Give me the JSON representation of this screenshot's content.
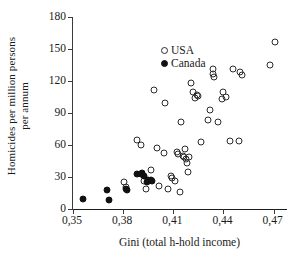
{
  "chart_data": {
    "type": "scatter",
    "title": "",
    "xlabel": "Gini (total h-hold income)",
    "ylabel_line1": "Homicides per million persons",
    "ylabel_line2": "per annum",
    "xlim": [
      0.35,
      0.478
    ],
    "ylim": [
      0,
      180
    ],
    "xticks": [
      0.35,
      0.38,
      0.41,
      0.44,
      0.47
    ],
    "xtick_labels": [
      "0,35",
      "0,38",
      "0,41",
      "0,44",
      "0,47"
    ],
    "yticks": [
      0,
      30,
      60,
      90,
      120,
      150,
      180
    ],
    "ytick_labels": [
      "0",
      "30",
      "60",
      "90",
      "120",
      "150",
      "180"
    ],
    "grid": false,
    "legend_position": "top-left",
    "marker_colors": {
      "usa": "#2b2b2b",
      "canada": "#111111"
    },
    "series": [
      {
        "name": "USA",
        "marker": "open-circle",
        "points": [
          [
            0.3805,
            25.5
          ],
          [
            0.3815,
            21.0
          ],
          [
            0.3885,
            65.0
          ],
          [
            0.3905,
            60.0
          ],
          [
            0.3925,
            26.5
          ],
          [
            0.3935,
            18.5
          ],
          [
            0.3965,
            36.5
          ],
          [
            0.3985,
            112.0
          ],
          [
            0.4,
            57.0
          ],
          [
            0.4015,
            22.0
          ],
          [
            0.4045,
            52.5
          ],
          [
            0.405,
            99.0
          ],
          [
            0.407,
            19.0
          ],
          [
            0.4085,
            31.0
          ],
          [
            0.4095,
            29.0
          ],
          [
            0.411,
            26.5
          ],
          [
            0.4125,
            53.5
          ],
          [
            0.413,
            52.0
          ],
          [
            0.414,
            15.5
          ],
          [
            0.4145,
            82.0
          ],
          [
            0.4155,
            50.0
          ],
          [
            0.4165,
            49.0
          ],
          [
            0.417,
            56.0
          ],
          [
            0.4175,
            47.0
          ],
          [
            0.418,
            43.0
          ],
          [
            0.4185,
            35.0
          ],
          [
            0.4195,
            48.5
          ],
          [
            0.4205,
            118.0
          ],
          [
            0.4215,
            110.0
          ],
          [
            0.423,
            104.0
          ],
          [
            0.424,
            107.0
          ],
          [
            0.425,
            106.0
          ],
          [
            0.4265,
            62.5
          ],
          [
            0.4305,
            83.0
          ],
          [
            0.432,
            93.0
          ],
          [
            0.4335,
            127.0
          ],
          [
            0.434,
            131.0
          ],
          [
            0.4345,
            124.0
          ],
          [
            0.4365,
            81.5
          ],
          [
            0.439,
            103.0
          ],
          [
            0.44,
            110.0
          ],
          [
            0.4415,
            105.0
          ],
          [
            0.444,
            64.0
          ],
          [
            0.4455,
            131.0
          ],
          [
            0.449,
            64.0
          ],
          [
            0.45,
            128.0
          ],
          [
            0.451,
            126.0
          ],
          [
            0.468,
            135.0
          ],
          [
            0.471,
            157.0
          ]
        ]
      },
      {
        "name": "Canada",
        "marker": "filled-circle",
        "points": [
          [
            0.356,
            9.0
          ],
          [
            0.3705,
            17.5
          ],
          [
            0.3715,
            8.0
          ],
          [
            0.3815,
            18.5
          ],
          [
            0.3825,
            17.5
          ],
          [
            0.388,
            32.5
          ],
          [
            0.3905,
            33.0
          ],
          [
            0.391,
            34.0
          ],
          [
            0.3925,
            30.5
          ],
          [
            0.394,
            25.5
          ],
          [
            0.395,
            27.5
          ],
          [
            0.3965,
            27.0
          ],
          [
            0.3975,
            26.5
          ]
        ]
      }
    ]
  },
  "legend": {
    "items": [
      {
        "label": "USA",
        "marker": "open-circle"
      },
      {
        "label": "Canada",
        "marker": "filled-circle"
      }
    ]
  }
}
